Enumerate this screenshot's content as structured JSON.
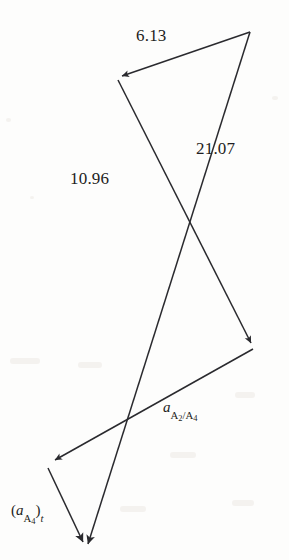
{
  "figure": {
    "type": "vector-polygon-diagram",
    "background_color": "#fdfdfc",
    "stroke_color": "#2a2a2e",
    "width": 289,
    "height": 560,
    "labels": [
      {
        "id": "label-6-13",
        "text": "6.13",
        "kind": "magnitude",
        "x": 136,
        "y": 27
      },
      {
        "id": "label-21-07",
        "text": "21.07",
        "kind": "magnitude",
        "x": 196,
        "y": 140
      },
      {
        "id": "label-10-96",
        "text": "10.96",
        "kind": "magnitude",
        "x": 70,
        "y": 170
      }
    ],
    "vector_labels": {
      "a_rel": {
        "base": "a",
        "sub_a": "A",
        "sub_a_num": "2",
        "slash": "/",
        "sub_b": "A",
        "sub_b_num": "4"
      },
      "a_tangential": {
        "open": "(",
        "base": "a",
        "sub_a": "A",
        "sub_a_num": "4",
        "close": ")",
        "post_sub": "t"
      }
    },
    "vectors": [
      {
        "name": "vector-6-13",
        "magnitude": "6.13",
        "from": [
          250,
          32
        ],
        "to": [
          120,
          77
        ],
        "arrow_at": "to"
      },
      {
        "name": "vector-10-96",
        "magnitude": "10.96",
        "from": [
          118,
          80
        ],
        "to": [
          253,
          347
        ],
        "arrow_at": "to"
      },
      {
        "name": "vector-21-07",
        "magnitude": "21.07",
        "from": [
          250,
          32
        ],
        "to": [
          88,
          548
        ],
        "arrow_at": "to"
      },
      {
        "name": "vector-a-a2-a4",
        "magnitude": "",
        "from": [
          253,
          349
        ],
        "to": [
          53,
          461
        ],
        "arrow_at": "to"
      },
      {
        "name": "vector-a-a4-t",
        "magnitude": "",
        "from": [
          48,
          468
        ],
        "to": [
          85,
          546
        ],
        "arrow_at": "to"
      }
    ]
  }
}
